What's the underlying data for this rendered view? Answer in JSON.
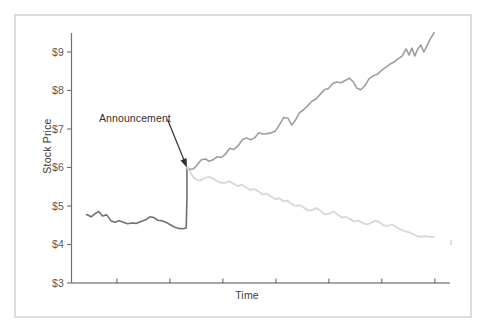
{
  "chart_data": {
    "type": "line",
    "title": "",
    "xlabel": "Time",
    "ylabel": "Stock Price",
    "ylim": [
      3,
      9.7
    ],
    "ytick_labels": [
      "$9",
      "$8",
      "$7",
      "$6",
      "$5",
      "$4",
      "$3"
    ],
    "ytick_values": [
      9,
      8,
      7,
      6,
      5,
      4,
      3
    ],
    "xlim": [
      0,
      100
    ],
    "xtick_values": [
      12,
      26,
      40,
      54,
      68,
      82,
      96
    ],
    "xtick_labels": [
      "",
      "",
      "",
      "",
      "",
      "",
      ""
    ],
    "grid": false,
    "legend": null,
    "annotations": [
      {
        "text": "Announcement",
        "label_x": 18.5,
        "label_y": 7.35,
        "arrow_to_x": 30.5,
        "arrow_to_y": 6.0
      }
    ],
    "series": [
      {
        "name": "pre-announcement",
        "color": "#6f7072",
        "width": 1.6,
        "points": [
          [
            4.0,
            4.78
          ],
          [
            5.2,
            4.72
          ],
          [
            6.2,
            4.8
          ],
          [
            7.2,
            4.86
          ],
          [
            8.2,
            4.74
          ],
          [
            9.3,
            4.77
          ],
          [
            10.4,
            4.62
          ],
          [
            11.5,
            4.58
          ],
          [
            12.6,
            4.62
          ],
          [
            13.7,
            4.58
          ],
          [
            14.8,
            4.54
          ],
          [
            16.0,
            4.56
          ],
          [
            17.2,
            4.55
          ],
          [
            18.4,
            4.6
          ],
          [
            19.6,
            4.64
          ],
          [
            20.7,
            4.72
          ],
          [
            21.8,
            4.7
          ],
          [
            22.8,
            4.63
          ],
          [
            23.8,
            4.62
          ],
          [
            24.9,
            4.58
          ],
          [
            26.0,
            4.52
          ],
          [
            27.0,
            4.46
          ],
          [
            28.2,
            4.42
          ],
          [
            29.4,
            4.41
          ],
          [
            30.3,
            4.43
          ],
          [
            30.5,
            5.2
          ],
          [
            30.5,
            6.0
          ]
        ]
      },
      {
        "name": "upper-path",
        "color": "#9d9ea0",
        "width": 1.6,
        "points": [
          [
            30.5,
            6.0
          ],
          [
            31.4,
            5.95
          ],
          [
            32.3,
            5.97
          ],
          [
            33.3,
            6.08
          ],
          [
            34.3,
            6.2
          ],
          [
            35.4,
            6.22
          ],
          [
            36.4,
            6.16
          ],
          [
            37.4,
            6.2
          ],
          [
            38.5,
            6.28
          ],
          [
            39.6,
            6.26
          ],
          [
            40.7,
            6.35
          ],
          [
            41.8,
            6.5
          ],
          [
            42.9,
            6.47
          ],
          [
            44.0,
            6.56
          ],
          [
            45.1,
            6.72
          ],
          [
            46.2,
            6.77
          ],
          [
            47.3,
            6.72
          ],
          [
            48.4,
            6.77
          ],
          [
            49.5,
            6.9
          ],
          [
            50.6,
            6.87
          ],
          [
            51.7,
            6.88
          ],
          [
            52.8,
            6.9
          ],
          [
            53.9,
            6.95
          ],
          [
            55.0,
            7.12
          ],
          [
            56.1,
            7.3
          ],
          [
            57.2,
            7.28
          ],
          [
            58.2,
            7.1
          ],
          [
            59.1,
            7.22
          ],
          [
            60.2,
            7.42
          ],
          [
            61.3,
            7.5
          ],
          [
            62.4,
            7.6
          ],
          [
            63.5,
            7.72
          ],
          [
            64.6,
            7.78
          ],
          [
            65.7,
            7.9
          ],
          [
            66.8,
            8.02
          ],
          [
            67.9,
            8.05
          ],
          [
            69.0,
            8.18
          ],
          [
            70.1,
            8.22
          ],
          [
            71.2,
            8.2
          ],
          [
            72.3,
            8.26
          ],
          [
            73.4,
            8.32
          ],
          [
            74.5,
            8.22
          ],
          [
            75.4,
            8.06
          ],
          [
            76.4,
            8.02
          ],
          [
            77.5,
            8.12
          ],
          [
            78.6,
            8.3
          ],
          [
            79.7,
            8.38
          ],
          [
            80.8,
            8.42
          ],
          [
            81.9,
            8.52
          ],
          [
            83.0,
            8.6
          ],
          [
            84.1,
            8.68
          ],
          [
            85.2,
            8.74
          ],
          [
            86.3,
            8.82
          ],
          [
            87.4,
            8.9
          ],
          [
            88.4,
            9.08
          ],
          [
            89.2,
            8.92
          ],
          [
            89.9,
            9.1
          ],
          [
            90.7,
            8.9
          ],
          [
            91.5,
            9.08
          ],
          [
            92.3,
            9.18
          ],
          [
            93.1,
            9.0
          ],
          [
            93.9,
            9.16
          ],
          [
            94.8,
            9.34
          ],
          [
            95.8,
            9.5
          ]
        ]
      },
      {
        "name": "lower-path",
        "color": "#d6d7d9",
        "width": 1.8,
        "points": [
          [
            30.5,
            6.0
          ],
          [
            31.3,
            5.9
          ],
          [
            32.1,
            5.76
          ],
          [
            33.0,
            5.68
          ],
          [
            34.0,
            5.66
          ],
          [
            35.1,
            5.72
          ],
          [
            36.2,
            5.76
          ],
          [
            37.3,
            5.72
          ],
          [
            38.4,
            5.65
          ],
          [
            39.5,
            5.6
          ],
          [
            40.6,
            5.6
          ],
          [
            41.7,
            5.64
          ],
          [
            42.8,
            5.58
          ],
          [
            43.9,
            5.52
          ],
          [
            45.0,
            5.55
          ],
          [
            46.1,
            5.48
          ],
          [
            47.2,
            5.42
          ],
          [
            48.3,
            5.44
          ],
          [
            49.4,
            5.38
          ],
          [
            50.5,
            5.3
          ],
          [
            51.6,
            5.32
          ],
          [
            52.7,
            5.25
          ],
          [
            53.8,
            5.18
          ],
          [
            54.9,
            5.2
          ],
          [
            56.0,
            5.12
          ],
          [
            57.1,
            5.14
          ],
          [
            58.2,
            5.05
          ],
          [
            59.3,
            5.0
          ],
          [
            60.4,
            5.02
          ],
          [
            61.5,
            4.95
          ],
          [
            62.6,
            4.88
          ],
          [
            63.7,
            4.9
          ],
          [
            64.8,
            4.95
          ],
          [
            65.9,
            4.86
          ],
          [
            67.0,
            4.78
          ],
          [
            68.1,
            4.8
          ],
          [
            69.2,
            4.86
          ],
          [
            70.3,
            4.78
          ],
          [
            71.4,
            4.7
          ],
          [
            72.5,
            4.72
          ],
          [
            73.6,
            4.66
          ],
          [
            74.7,
            4.6
          ],
          [
            75.8,
            4.62
          ],
          [
            76.9,
            4.56
          ],
          [
            78.0,
            4.52
          ],
          [
            79.1,
            4.56
          ],
          [
            80.2,
            4.62
          ],
          [
            81.3,
            4.58
          ],
          [
            82.4,
            4.5
          ],
          [
            83.5,
            4.48
          ],
          [
            84.6,
            4.52
          ],
          [
            85.7,
            4.46
          ],
          [
            86.8,
            4.4
          ],
          [
            87.9,
            4.35
          ],
          [
            89.0,
            4.32
          ],
          [
            90.1,
            4.28
          ],
          [
            91.2,
            4.22
          ],
          [
            92.3,
            4.2
          ],
          [
            93.4,
            4.22
          ],
          [
            94.5,
            4.2
          ],
          [
            95.8,
            4.2
          ]
        ]
      }
    ],
    "axis_color": "#6f7072"
  }
}
